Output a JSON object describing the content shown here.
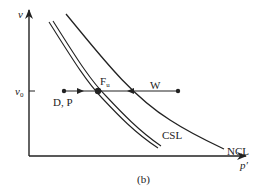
{
  "figure": {
    "caption": "(b)",
    "axes": {
      "y_label": "v",
      "x_label": "p′",
      "y_tick_label_main": "v",
      "y_tick_label_sub": "0"
    },
    "curves": [
      {
        "name": "NCL",
        "label": "NCL",
        "style": "single"
      },
      {
        "name": "CSL",
        "label": "CSL",
        "style": "double"
      }
    ],
    "points": {
      "start_label": "D, P",
      "end_label_main": "F",
      "end_label_sub": "u",
      "other_label": "W"
    },
    "colors": {
      "line": "#222222",
      "background": "#ffffff"
    }
  }
}
